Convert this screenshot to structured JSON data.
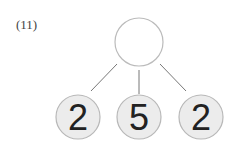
{
  "problem_number": "(11)",
  "top_node": {
    "value": ""
  },
  "children": [
    {
      "value": "2"
    },
    {
      "value": "5"
    },
    {
      "value": "2"
    }
  ],
  "colors": {
    "node_fill": "#ececec",
    "node_stroke": "#b8b8b8",
    "line": "#777777",
    "text": "#222222"
  }
}
